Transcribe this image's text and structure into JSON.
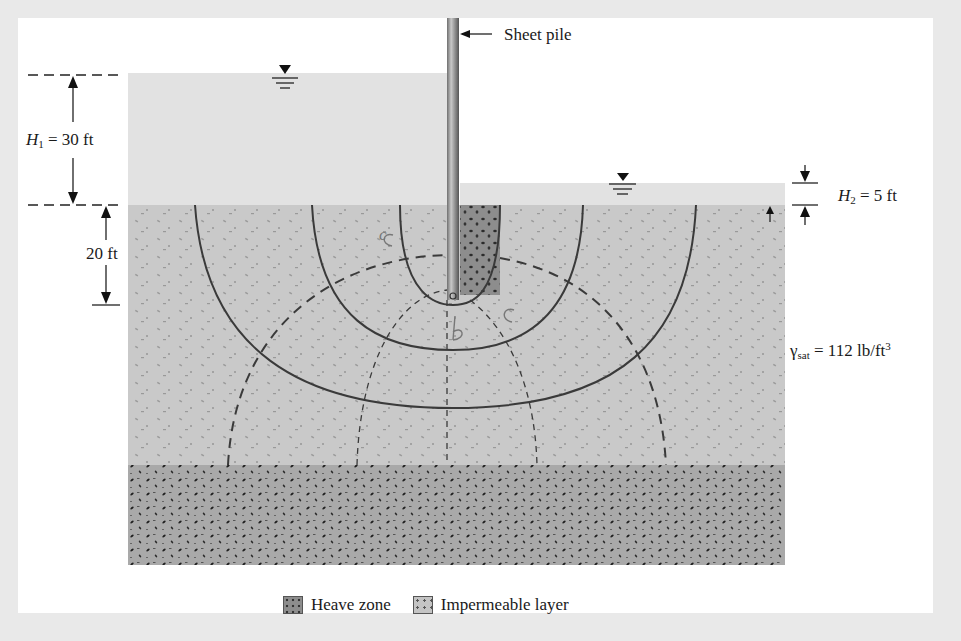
{
  "diagram": {
    "labels": {
      "sheet_pile": "Sheet pile",
      "h1_symbol": "H",
      "h1_sub": "1",
      "h1_value": " = 30 ft",
      "h2_symbol": "H",
      "h2_sub": "2",
      "h2_value": " = 5 ft",
      "depth": "20 ft",
      "gamma_symbol": "γ",
      "gamma_sub": "sat",
      "gamma_value": " = 112 lb/ft",
      "gamma_sup": "3"
    },
    "handwritten": {
      "c_left": "c",
      "b": "b",
      "c_right": "c"
    },
    "legend": [
      {
        "name": "heave-zone",
        "label": "Heave zone"
      },
      {
        "name": "impermeable-layer",
        "label": "Impermeable layer"
      }
    ],
    "values": {
      "H1_ft": 30,
      "H2_ft": 5,
      "embedment_ft": 20,
      "gamma_sat_lb_ft3": 112
    },
    "colors": {
      "frame": "#e9e9e9",
      "water": "#e2e2e2",
      "soil": "#c9c9c9",
      "impermeable": "#a9a9a9",
      "heave": "#8d8d8d",
      "lines": "#3a3a3a"
    }
  }
}
